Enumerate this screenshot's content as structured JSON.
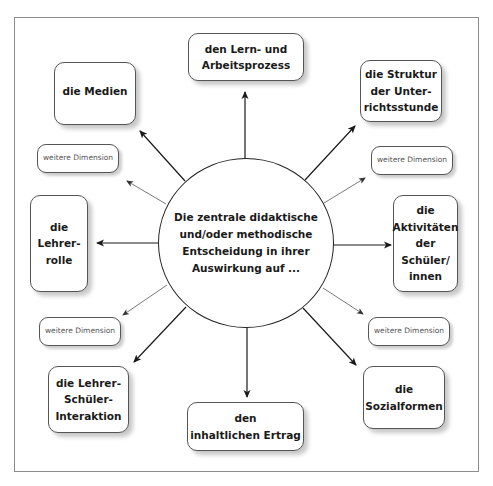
{
  "diagram": {
    "center": {
      "text": "Die zentrale didaktische\nund/oder methodische\nEntscheidung in ihrer\nAuswirkung auf ..."
    },
    "nodes": [
      {
        "id": "lern-arbeitsprozess",
        "text": "den Lern- und\nArbeitsprozess",
        "position": "top"
      },
      {
        "id": "struktur",
        "text": "die Struktur\nder Unter-\nrichtsstunde",
        "position": "top-right"
      },
      {
        "id": "aktivitaeten",
        "text": "die\nAktivitäten\nder\nSchüler/\ninnen",
        "position": "right"
      },
      {
        "id": "sozialformen",
        "text": "die\nSozialformen",
        "position": "bottom-right"
      },
      {
        "id": "inhaltlicher-ertrag",
        "text": "den\ninhaltlichen Ertrag",
        "position": "bottom"
      },
      {
        "id": "lehrer-schueler-interaktion",
        "text": "die Lehrer-\nSchüler-\nInteraktion",
        "position": "bottom-left"
      },
      {
        "id": "lehrerrolle",
        "text": "die\nLehrer-\nrolle",
        "position": "left"
      },
      {
        "id": "medien",
        "text": "die Medien",
        "position": "top-left"
      }
    ],
    "extra_dimensions": [
      {
        "id": "dim-top-left",
        "text": "weitere Dimension"
      },
      {
        "id": "dim-top-right",
        "text": "weitere Dimension"
      },
      {
        "id": "dim-bottom-left",
        "text": "weitere Dimension"
      },
      {
        "id": "dim-bottom-right",
        "text": "weitere Dimension"
      }
    ],
    "colors": {
      "border": "#555555",
      "arrow": "#1a1a1a",
      "thin_arrow": "#555555",
      "frame": "#8c8c8c"
    }
  }
}
